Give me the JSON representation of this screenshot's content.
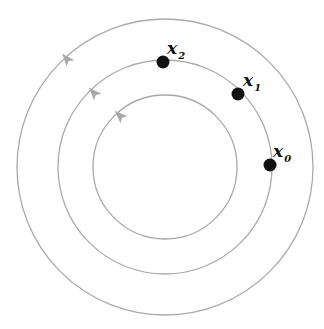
{
  "diagram": {
    "type": "concentric-orbits",
    "center": [
      165,
      167
    ],
    "stroke_color": "#a9a9a9",
    "arrow_color": "#a9a9a9",
    "point_color": "#111111",
    "circles": [
      {
        "name": "outer",
        "r": 148,
        "arrow_angle_deg": 140
      },
      {
        "name": "middle",
        "r": 107,
        "arrow_angle_deg": 140
      },
      {
        "name": "inner",
        "r": 72,
        "arrow_angle_deg": 140
      }
    ],
    "points": [
      {
        "id": "x0",
        "symbol": "x",
        "subscript": "0",
        "cx": 270,
        "cy": 165
      },
      {
        "id": "x1",
        "symbol": "x",
        "subscript": "1",
        "cx": 238,
        "cy": 94
      },
      {
        "id": "x2",
        "symbol": "x",
        "subscript": "2",
        "cx": 163,
        "cy": 62
      }
    ]
  }
}
